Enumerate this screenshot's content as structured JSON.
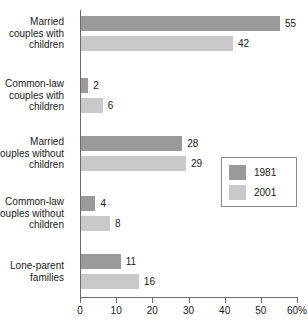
{
  "chart_data": {
    "type": "bar",
    "orientation": "horizontal",
    "title": "",
    "subtitle": "",
    "xlabel": "",
    "ylabel": "",
    "xlim": [
      0,
      60
    ],
    "grid": false,
    "legend_position": "center-right",
    "axis_unit_suffix": "%",
    "tick_values": [
      0,
      10,
      20,
      30,
      40,
      50,
      60
    ],
    "tick_labels": [
      "0",
      "10",
      "20",
      "30",
      "40",
      "50",
      "60%"
    ],
    "categories": [
      "Married couples with children",
      "Common-law couples with children",
      "Married couples without children",
      "Common-law couples without children",
      "Lone-parent families"
    ],
    "category_lines": [
      [
        "Married",
        "couples with",
        "children"
      ],
      [
        "Common-law",
        "couples with",
        "children"
      ],
      [
        "Married",
        "couples without",
        "children"
      ],
      [
        "Common-law",
        "couples without",
        "children"
      ],
      [
        "Lone-parent",
        "families"
      ]
    ],
    "series": [
      {
        "name": "1981",
        "color": "#9a9a9a",
        "values": [
          55,
          2,
          28,
          4,
          11
        ]
      },
      {
        "name": "2001",
        "color": "#c9c9c9",
        "values": [
          42,
          6,
          29,
          8,
          16
        ]
      }
    ],
    "value_labels": [
      [
        "55",
        "42"
      ],
      [
        "2",
        "6"
      ],
      [
        "28",
        "29"
      ],
      [
        "4",
        "8"
      ],
      [
        "11",
        "16"
      ]
    ]
  },
  "legend": {
    "entries": [
      {
        "label": "1981",
        "color": "#9a9a9a"
      },
      {
        "label": "2001",
        "color": "#c9c9c9"
      }
    ]
  },
  "colors": {
    "series_1981": "#9a9a9a",
    "series_2001": "#c9c9c9",
    "axis": "#6b6b6b",
    "text": "#1a1a1a",
    "background": "#ffffff"
  }
}
